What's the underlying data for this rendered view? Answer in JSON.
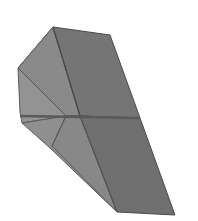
{
  "figure": {
    "background": "#ffffff",
    "colors": {
      "left_upper_face": "#8a8a8a",
      "right_upper_face": "#747474",
      "left_lower_face": "#8f8f8f",
      "right_lower_face": "#6e6e6e",
      "left_wing_face": "#9a9a9a",
      "edge": "#4a4a4a",
      "ridge": "#5a5a5a"
    }
  }
}
